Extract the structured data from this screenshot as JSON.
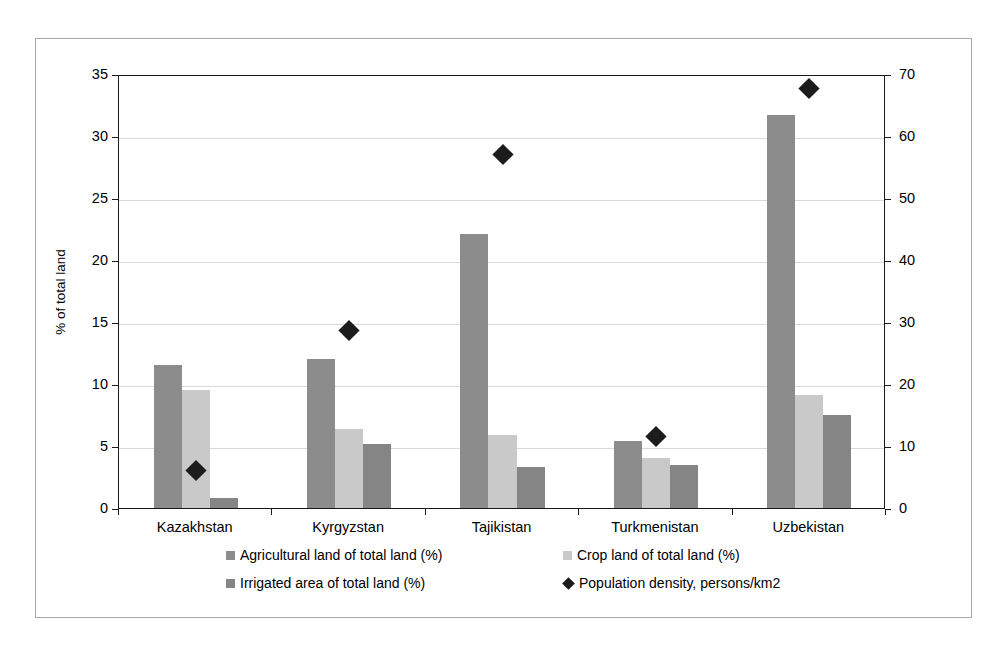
{
  "chart_data": {
    "type": "bar",
    "title": "",
    "subtitle": "",
    "xlabel": "",
    "ylabel": "% of total land",
    "y2label": "Population density, persons/km²",
    "categories": [
      "Kazakhstan",
      "Kyrgyzstan",
      "Tajikistan",
      "Turkmenistan",
      "Uzbekistan"
    ],
    "ylim": [
      0,
      35
    ],
    "yticks": [
      0,
      5,
      10,
      15,
      20,
      25,
      30,
      35
    ],
    "ytick_labels": [
      "0",
      "5",
      "10",
      "15",
      "20",
      "25",
      "30",
      "35"
    ],
    "y2lim": [
      0,
      70
    ],
    "y2ticks": [
      0,
      10,
      20,
      30,
      40,
      50,
      60,
      70
    ],
    "y2tick_labels": [
      "0",
      "10",
      "20",
      "30",
      "40",
      "50",
      "60",
      "70"
    ],
    "grid": true,
    "legend_position": "bottom",
    "series": [
      {
        "name": "Agricultural land of total land (%)",
        "type": "bar",
        "axis": "left",
        "color": "#8c8c8c",
        "values": [
          11.5,
          12.0,
          22.1,
          5.4,
          31.7
        ]
      },
      {
        "name": "Crop land of total land (%)",
        "type": "bar",
        "axis": "left",
        "color": "#c9c9c9",
        "values": [
          9.5,
          6.4,
          5.9,
          4.0,
          9.1
        ]
      },
      {
        "name": "Irrigated area of total land (%)",
        "type": "bar",
        "axis": "left",
        "color": "#858585",
        "values": [
          0.8,
          5.15,
          3.3,
          3.45,
          7.5
        ]
      },
      {
        "name": "Population density, persons/km2",
        "type": "scatter",
        "axis": "right",
        "color": "#1c1c1c",
        "marker": "diamond",
        "values": [
          6.4,
          29.0,
          57.4,
          11.8,
          68.0
        ]
      }
    ]
  },
  "legend": {
    "items": [
      {
        "label": "Agricultural land of total land (%)",
        "marker": "square",
        "color": "#8c8c8c"
      },
      {
        "label": "Crop land of total land (%)",
        "marker": "square",
        "color": "#c9c9c9"
      },
      {
        "label": "Irrigated area of total land (%)",
        "marker": "square",
        "color": "#858585"
      },
      {
        "label": "Population density, persons/km2",
        "marker": "diamond",
        "color": "#1c1c1c"
      }
    ]
  }
}
